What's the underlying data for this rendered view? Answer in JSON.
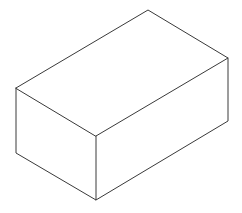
{
  "figure": {
    "stroke_color": "#3a3a3a",
    "background": "#ffffff",
    "vertices": {
      "top_back": [
        148,
        10
      ],
      "right_top": [
        228,
        58
      ],
      "right_bottom": [
        228,
        121
      ],
      "left_top": [
        16,
        88
      ],
      "left_bottom": [
        16,
        153
      ],
      "front_top": [
        96,
        136
      ],
      "front_bottom": [
        96,
        200
      ]
    }
  }
}
